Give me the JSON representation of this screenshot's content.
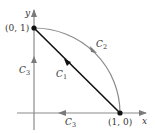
{
  "diagram": {
    "type": "vector-path-diagram",
    "axes": {
      "x_label": "x",
      "y_label": "y",
      "color": "#8a8a8a"
    },
    "points": [
      {
        "name": "point-0-1",
        "label": "(0, 1)",
        "coords": [
          0,
          1
        ]
      },
      {
        "name": "point-1-0",
        "label": "(1, 0)",
        "coords": [
          1,
          0
        ]
      }
    ],
    "curves": [
      {
        "id": "C1",
        "label": "C",
        "subscript": "1",
        "description": "straight line from (1,0) to (0,1)",
        "color": "#111111"
      },
      {
        "id": "C2",
        "label": "C",
        "subscript": "2",
        "description": "quarter-circle arc from (0,1) to (1,0)",
        "color": "#8a8a8a"
      },
      {
        "id": "C3a",
        "label": "C",
        "subscript": "3",
        "description": "along x-axis from (1,0) toward origin",
        "color": "#8a8a8a"
      },
      {
        "id": "C3b",
        "label": "C",
        "subscript": "3",
        "description": "along y-axis from origin to (0,1)",
        "color": "#8a8a8a"
      }
    ],
    "colors": {
      "axis": "#8a8a8a",
      "line": "#111111",
      "arc": "#8a8a8a",
      "text": "#333333"
    }
  }
}
